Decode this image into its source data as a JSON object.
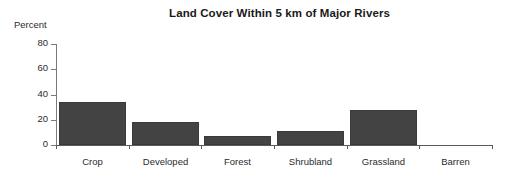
{
  "chart_data": {
    "type": "bar",
    "title": "Land Cover Within 5 km of Major Rivers",
    "xlabel": "",
    "ylabel": "Percent",
    "categories": [
      "Crop",
      "Developed",
      "Forest",
      "Shrubland",
      "Grassland",
      "Barren"
    ],
    "values": [
      34,
      18,
      7,
      11,
      28,
      0
    ],
    "ylim": [
      0,
      80
    ],
    "yticks": [
      0,
      20,
      40,
      60,
      80
    ],
    "ytick_labels": [
      "0",
      "20",
      "40",
      "60",
      "80"
    ],
    "grid": false,
    "legend": false,
    "legend_position": "none",
    "bar_color": "#434343",
    "axis_color": "#5a5a5a",
    "text_color": "#2b2b2b",
    "background": "#ffffff"
  }
}
